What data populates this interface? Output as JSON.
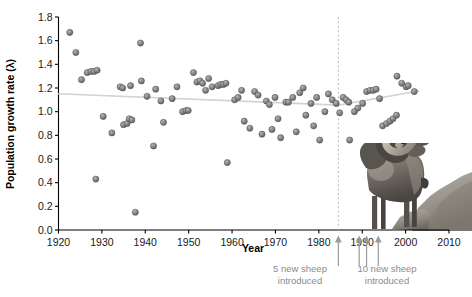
{
  "figure": {
    "background_color": "#ffffff",
    "point_color": "#7f7f7f",
    "trend_color": "#d2d2d2",
    "annotation_color": "#8b8b8b"
  },
  "axes": {
    "x_title": "Year",
    "y_title": "Population growth rate (λ)",
    "x_ticks": [
      "1920",
      "1930",
      "1940",
      "1950",
      "1960",
      "1970",
      "1980",
      "1990",
      "2000",
      "2010"
    ],
    "y_ticks": [
      "0.0",
      "0.2",
      "0.4",
      "0.6",
      "0.8",
      "1.0",
      "1.2",
      "1.4",
      "1.6",
      "1.8"
    ]
  },
  "annotations": {
    "first_intro_line1": "5 new sheep",
    "first_intro_line2": "introduced",
    "second_intro_line1": "10 new sheep",
    "second_intro_line2": "introduced"
  },
  "image_caption": {
    "subject": "bighorn-sheep-photograph"
  },
  "chart_data": {
    "type": "scatter",
    "title": "",
    "xlabel": "Year",
    "ylabel": "Population growth rate (λ)",
    "xlim": [
      1920,
      2010
    ],
    "ylim": [
      0.0,
      1.8
    ],
    "xticks": [
      1920,
      1930,
      1940,
      1950,
      1960,
      1970,
      1980,
      1990,
      2000,
      2010
    ],
    "yticks": [
      0.0,
      0.2,
      0.4,
      0.6,
      0.8,
      1.0,
      1.2,
      1.4,
      1.6,
      1.8
    ],
    "grid": false,
    "legend": null,
    "marker_color": "#7f7f7f",
    "points": [
      [
        1922.6,
        1.67
      ],
      [
        1924.0,
        1.5
      ],
      [
        1925.3,
        1.27
      ],
      [
        1926.6,
        1.33
      ],
      [
        1927.5,
        1.34
      ],
      [
        1928.2,
        1.34
      ],
      [
        1928.9,
        1.35
      ],
      [
        1928.6,
        0.43
      ],
      [
        1930.3,
        0.96
      ],
      [
        1932.3,
        0.82
      ],
      [
        1934.2,
        1.21
      ],
      [
        1934.8,
        1.2
      ],
      [
        1935.0,
        0.89
      ],
      [
        1935.8,
        0.9
      ],
      [
        1936.6,
        1.22
      ],
      [
        1936.3,
        0.94
      ],
      [
        1936.9,
        0.93
      ],
      [
        1937.7,
        0.15
      ],
      [
        1938.9,
        1.58
      ],
      [
        1939.1,
        1.26
      ],
      [
        1940.4,
        1.13
      ],
      [
        1941.9,
        0.71
      ],
      [
        1942.4,
        1.19
      ],
      [
        1943.6,
        1.09
      ],
      [
        1944.2,
        0.91
      ],
      [
        1946.2,
        1.11
      ],
      [
        1947.3,
        1.21
      ],
      [
        1948.6,
        1.0
      ],
      [
        1949.4,
        1.01
      ],
      [
        1949.9,
        1.01
      ],
      [
        1951.1,
        1.33
      ],
      [
        1951.9,
        1.25
      ],
      [
        1952.6,
        1.26
      ],
      [
        1953.2,
        1.24
      ],
      [
        1953.9,
        1.18
      ],
      [
        1954.6,
        1.28
      ],
      [
        1955.4,
        1.21
      ],
      [
        1956.8,
        1.22
      ],
      [
        1957.4,
        1.23
      ],
      [
        1958.0,
        1.23
      ],
      [
        1958.6,
        1.24
      ],
      [
        1958.9,
        0.57
      ],
      [
        1960.6,
        1.1
      ],
      [
        1961.4,
        1.12
      ],
      [
        1962.2,
        1.18
      ],
      [
        1962.8,
        0.92
      ],
      [
        1964.1,
        0.86
      ],
      [
        1965.2,
        1.17
      ],
      [
        1966.0,
        1.14
      ],
      [
        1966.9,
        0.81
      ],
      [
        1967.9,
        1.09
      ],
      [
        1968.6,
        1.06
      ],
      [
        1969.2,
        0.85
      ],
      [
        1969.9,
        1.12
      ],
      [
        1970.6,
        0.94
      ],
      [
        1971.2,
        0.78
      ],
      [
        1972.4,
        1.08
      ],
      [
        1973.0,
        1.08
      ],
      [
        1974.0,
        1.12
      ],
      [
        1974.8,
        0.83
      ],
      [
        1975.6,
        1.16
      ],
      [
        1976.4,
        1.2
      ],
      [
        1977.0,
        0.97
      ],
      [
        1978.2,
        1.07
      ],
      [
        1978.8,
        0.88
      ],
      [
        1979.5,
        1.12
      ],
      [
        1980.2,
        0.76
      ],
      [
        1981.4,
        1.0
      ],
      [
        1982.2,
        1.15
      ],
      [
        1983.1,
        1.1
      ],
      [
        1984.0,
        1.07
      ],
      [
        1984.8,
        0.99
      ],
      [
        1985.6,
        1.12
      ],
      [
        1986.3,
        1.1
      ],
      [
        1986.9,
        1.08
      ],
      [
        1987.1,
        0.76
      ],
      [
        1988.2,
        1.0
      ],
      [
        1989.0,
        1.03
      ],
      [
        1990.1,
        1.07
      ],
      [
        1991.0,
        1.17
      ],
      [
        1991.8,
        1.18
      ],
      [
        1992.5,
        1.18
      ],
      [
        1993.2,
        1.19
      ],
      [
        1994.0,
        1.11
      ],
      [
        1994.7,
        0.88
      ],
      [
        1995.6,
        0.9
      ],
      [
        1996.4,
        0.92
      ],
      [
        1997.1,
        0.94
      ],
      [
        1997.9,
        0.97
      ],
      [
        1998.0,
        1.3
      ],
      [
        1999.1,
        1.24
      ],
      [
        2000.1,
        1.21
      ],
      [
        2000.6,
        1.22
      ],
      [
        2002.0,
        1.17
      ]
    ],
    "trend_lines": [
      {
        "name": "pre-introduction",
        "x": [
          1920.0,
          1984.5
        ],
        "y": [
          1.152,
          1.055
        ]
      },
      {
        "name": "post-introduction",
        "x": [
          1984.5,
          2003.0
        ],
        "y": [
          1.055,
          1.175
        ]
      }
    ],
    "vertical_reference_line": {
      "x": 1984.5,
      "style": "dashed"
    },
    "event_arrows": [
      {
        "x": 1984.5,
        "label": "5 new sheep introduced"
      },
      {
        "x": 1989.3,
        "label": "10 new sheep introduced"
      },
      {
        "x": 1991.0,
        "label": "10 new sheep introduced"
      },
      {
        "x": 1993.7,
        "label": "10 new sheep introduced"
      }
    ]
  }
}
